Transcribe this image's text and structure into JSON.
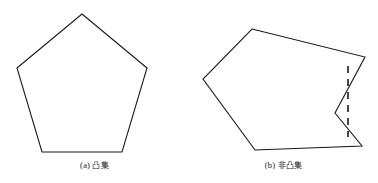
{
  "figure": {
    "background_color": "#ffffff",
    "stroke_color": "#1a1a1a",
    "stroke_width": 1.1,
    "width": 378,
    "height": 183,
    "panels": [
      {
        "id": "panel-a",
        "caption_label": "(a)",
        "caption_text": "凸集",
        "caption_full": "(a) 凸集",
        "shape_name": "convex-pentagon",
        "shape_kind": "polygon",
        "is_convex": true,
        "points": "82,14 147,68 122,152 42,152 17,68",
        "vertices": [
          {
            "x": 82,
            "y": 14
          },
          {
            "x": 147,
            "y": 68
          },
          {
            "x": 122,
            "y": 152
          },
          {
            "x": 42,
            "y": 152
          },
          {
            "x": 17,
            "y": 68
          }
        ],
        "has_dashed_segment": false
      },
      {
        "id": "panel-b",
        "caption_label": "(b)",
        "caption_text": "非凸集",
        "caption_full": "(b) 非凸集",
        "shape_name": "nonconvex-polygon",
        "shape_kind": "polygon",
        "is_convex": false,
        "points": "63,29 176,57 146,113 173,146 66,150 14,79",
        "vertices": [
          {
            "x": 63,
            "y": 29
          },
          {
            "x": 176,
            "y": 57
          },
          {
            "x": 146,
            "y": 113
          },
          {
            "x": 173,
            "y": 146
          },
          {
            "x": 66,
            "y": 150
          },
          {
            "x": 14,
            "y": 79
          }
        ],
        "reflex_vertex": {
          "x": 146,
          "y": 113
        },
        "has_dashed_segment": true,
        "dashed_segment": {
          "x1": 159,
          "y1": 66,
          "x2": 159,
          "y2": 137,
          "dash_pattern": "7,6",
          "stroke_width": 1.6
        }
      }
    ]
  }
}
